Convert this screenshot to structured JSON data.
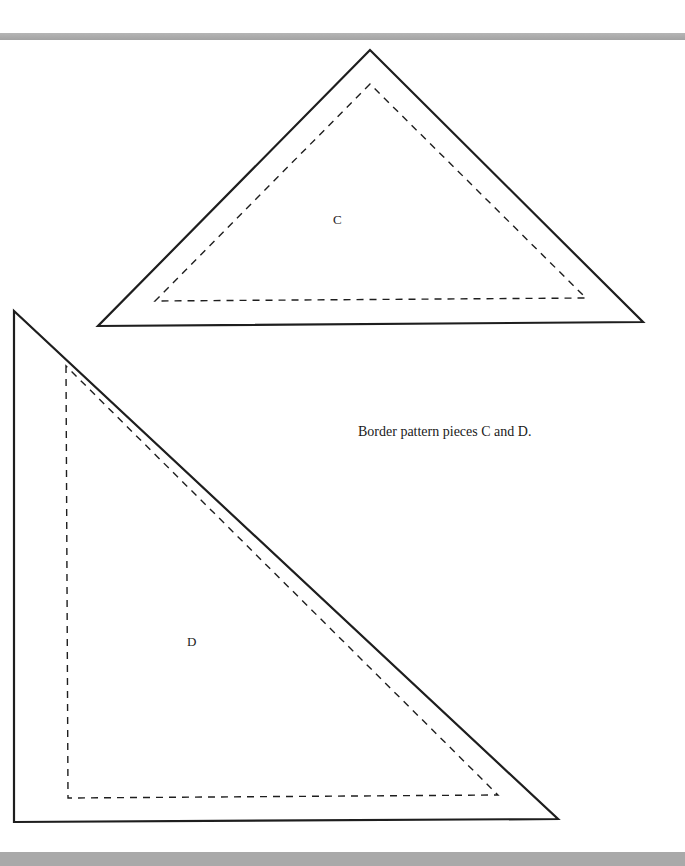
{
  "page": {
    "caption": "Border pattern pieces C and D."
  },
  "pieces": [
    {
      "label": "C",
      "outer": [
        [
          370,
          50
        ],
        [
          98,
          326
        ],
        [
          643,
          322
        ]
      ],
      "inner": [
        [
          370,
          84
        ],
        [
          155,
          301
        ],
        [
          586,
          298
        ]
      ],
      "label_pos": [
        333,
        212
      ]
    },
    {
      "label": "D",
      "outer": [
        [
          14,
          311
        ],
        [
          14,
          822
        ],
        [
          558,
          819
        ]
      ],
      "inner": [
        [
          66,
          366
        ],
        [
          68,
          798
        ],
        [
          498,
          795
        ]
      ],
      "label_pos": [
        187,
        634
      ]
    }
  ],
  "colors": {
    "stroke": "#1e1e1e",
    "bar": "#a9a9a9"
  }
}
